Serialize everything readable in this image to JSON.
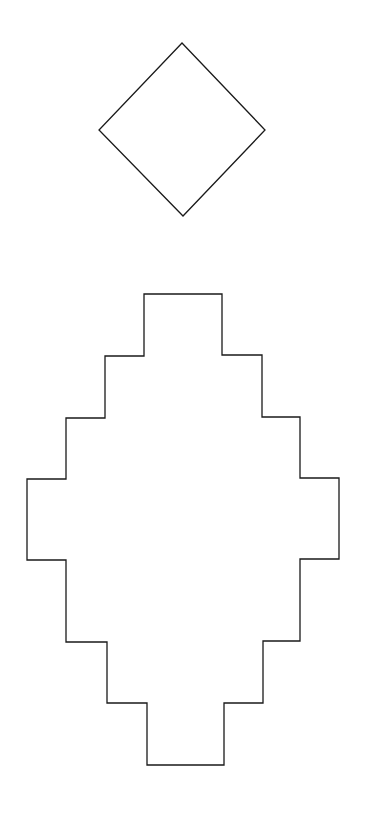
{
  "canvas": {
    "width": 367,
    "height": 816,
    "background": "#ffffff"
  },
  "stroke": {
    "color": "#1a1a1a",
    "width": 1.3
  },
  "shapes": {
    "diamond": {
      "description": "rotated square outline",
      "points": "182,43 265,130 183,216 99,130"
    },
    "stepped_diamond": {
      "description": "stepped (staircase) diamond outline",
      "points": "144,294 222,294 222,355 262,355 262,417 300,417 300,478 339,478 339,559 300,559 300,641 263,641 263,703 224,703 224,765 147,765 147,703 107,703 107,642 66,642 66,560 27,560 27,479 66,479 66,418 105,418 105,356 144,356"
    }
  }
}
